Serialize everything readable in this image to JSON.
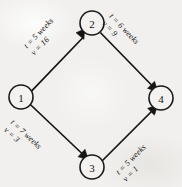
{
  "diagram": {
    "type": "directed-network-graph",
    "title": "",
    "background_color": "#f1f0ee",
    "line_color": "#151515",
    "nodes": [
      {
        "id": "1",
        "label": "1",
        "cx": 21,
        "cy": 97,
        "r": 12
      },
      {
        "id": "2",
        "label": "2",
        "cx": 92,
        "cy": 23,
        "r": 12
      },
      {
        "id": "3",
        "label": "3",
        "cx": 92,
        "cy": 167,
        "r": 12
      },
      {
        "id": "4",
        "label": "4",
        "cx": 161,
        "cy": 98,
        "r": 12
      }
    ],
    "edges": [
      {
        "id": "edge-1-2",
        "from": "1",
        "to": "2",
        "time_label": "t = 5 weeks",
        "value_label": "v = 16",
        "time": 5,
        "value": 16,
        "units": "weeks"
      },
      {
        "id": "edge-2-4",
        "from": "2",
        "to": "4",
        "time_label": "t = 6 weeks",
        "value_label": "v = 9",
        "time": 6,
        "value": 9,
        "units": "weeks"
      },
      {
        "id": "edge-1-3",
        "from": "1",
        "to": "3",
        "time_label": "t = 7 weeks",
        "value_label": "v = 3",
        "time": 7,
        "value": 3,
        "units": "weeks"
      },
      {
        "id": "edge-3-4",
        "from": "3",
        "to": "4",
        "time_label": "t = 5 weeks",
        "value_label": "v = 1",
        "time": 5,
        "value": 1,
        "units": "weeks"
      }
    ]
  }
}
